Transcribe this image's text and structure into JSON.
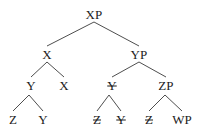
{
  "figure": {
    "type": "syntax-tree",
    "title": "",
    "background_color": "#ffffff",
    "line_color": "#3a3a3a",
    "text_color": "#1c1c1c"
  },
  "nodes": [
    {
      "id": "n0",
      "label": "XP",
      "struck": false,
      "x": 94,
      "y": 14
    },
    {
      "id": "n1",
      "label": "X",
      "struck": false,
      "x": 47,
      "y": 54
    },
    {
      "id": "n2",
      "label": "YP",
      "struck": false,
      "x": 139,
      "y": 54
    },
    {
      "id": "n3",
      "label": "Y",
      "struck": false,
      "x": 31,
      "y": 85
    },
    {
      "id": "n4",
      "label": "X",
      "struck": false,
      "x": 64,
      "y": 85
    },
    {
      "id": "n5",
      "label": "Y",
      "struck": true,
      "x": 112,
      "y": 85
    },
    {
      "id": "n6",
      "label": "ZP",
      "struck": false,
      "x": 166,
      "y": 85
    },
    {
      "id": "n7",
      "label": "Z",
      "struck": false,
      "x": 13,
      "y": 119
    },
    {
      "id": "n8",
      "label": "Y",
      "struck": false,
      "x": 43,
      "y": 119
    },
    {
      "id": "n9",
      "label": "Z",
      "struck": true,
      "x": 97,
      "y": 119
    },
    {
      "id": "n10",
      "label": "Y",
      "struck": true,
      "x": 121,
      "y": 119
    },
    {
      "id": "n11",
      "label": "Z",
      "struck": true,
      "x": 149,
      "y": 119
    },
    {
      "id": "n12",
      "label": "WP",
      "struck": false,
      "x": 182,
      "y": 119
    }
  ],
  "edges": [
    {
      "id": "e0",
      "from": "n0",
      "to": "n1",
      "x1": 94,
      "y1": 22,
      "x2": 47,
      "y2": 46
    },
    {
      "id": "e1",
      "from": "n0",
      "to": "n2",
      "x1": 94,
      "y1": 22,
      "x2": 139,
      "y2": 46
    },
    {
      "id": "e2",
      "from": "n1",
      "to": "n3",
      "x1": 47,
      "y1": 62,
      "x2": 31,
      "y2": 77
    },
    {
      "id": "e3",
      "from": "n1",
      "to": "n4",
      "x1": 47,
      "y1": 62,
      "x2": 64,
      "y2": 77
    },
    {
      "id": "e4",
      "from": "n2",
      "to": "n5",
      "x1": 139,
      "y1": 62,
      "x2": 112,
      "y2": 77
    },
    {
      "id": "e5",
      "from": "n2",
      "to": "n6",
      "x1": 139,
      "y1": 62,
      "x2": 166,
      "y2": 77
    },
    {
      "id": "e6",
      "from": "n3",
      "to": "n7",
      "x1": 29,
      "y1": 95,
      "x2": 13,
      "y2": 111
    },
    {
      "id": "e7",
      "from": "n3",
      "to": "n8",
      "x1": 29,
      "y1": 95,
      "x2": 43,
      "y2": 111
    },
    {
      "id": "e8",
      "from": "n5",
      "to": "n9",
      "x1": 109,
      "y1": 95,
      "x2": 97,
      "y2": 111
    },
    {
      "id": "e9",
      "from": "n5",
      "to": "n10",
      "x1": 109,
      "y1": 95,
      "x2": 121,
      "y2": 111
    },
    {
      "id": "e10",
      "from": "n6",
      "to": "n11",
      "x1": 165,
      "y1": 95,
      "x2": 149,
      "y2": 111
    },
    {
      "id": "e11",
      "from": "n6",
      "to": "n12",
      "x1": 165,
      "y1": 95,
      "x2": 182,
      "y2": 111
    }
  ]
}
